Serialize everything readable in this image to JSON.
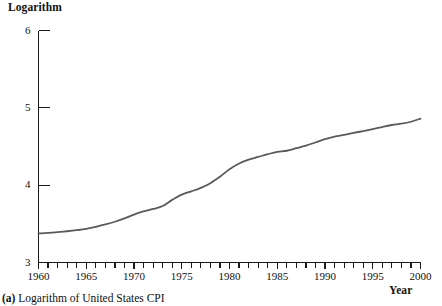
{
  "figure": {
    "caption_id": "(a)",
    "caption_text": " Logarithm of United States CPI"
  },
  "chart_data": {
    "type": "line",
    "title": "",
    "subtitle": "",
    "xlabel": "Year",
    "ylabel": "Logarithm",
    "xlim": [
      1960,
      2000
    ],
    "ylim": [
      3,
      6
    ],
    "grid": false,
    "legend": "none",
    "line_color": "#5a5a5a",
    "axis_color": "#1a1a1a",
    "y_ticks": [
      3,
      4,
      5,
      6
    ],
    "y_tick_labels": [
      "3",
      "4",
      "5",
      "6"
    ],
    "x_major_ticks": [
      1960,
      1965,
      1970,
      1975,
      1980,
      1985,
      1990,
      1995,
      2000
    ],
    "x_major_tick_labels": [
      "1960",
      "1965",
      "1970",
      "1975",
      "1980",
      "1985",
      "1990",
      "1995",
      "2000"
    ],
    "x_minor_tick_step": 1,
    "series": [
      {
        "name": "Logarithm of United States CPI",
        "x": [
          1960,
          1961,
          1962,
          1963,
          1964,
          1965,
          1966,
          1967,
          1968,
          1969,
          1970,
          1971,
          1972,
          1973,
          1974,
          1975,
          1976,
          1977,
          1978,
          1979,
          1980,
          1981,
          1982,
          1983,
          1984,
          1985,
          1986,
          1987,
          1988,
          1989,
          1990,
          1991,
          1992,
          1993,
          1994,
          1995,
          1996,
          1997,
          1998,
          1999,
          2000
        ],
        "values": [
          3.375,
          3.382,
          3.392,
          3.404,
          3.418,
          3.435,
          3.462,
          3.492,
          3.527,
          3.57,
          3.62,
          3.66,
          3.692,
          3.73,
          3.81,
          3.878,
          3.92,
          3.965,
          4.025,
          4.11,
          4.205,
          4.28,
          4.33,
          4.365,
          4.4,
          4.43,
          4.445,
          4.478,
          4.512,
          4.552,
          4.595,
          4.628,
          4.65,
          4.675,
          4.7,
          4.725,
          4.752,
          4.778,
          4.795,
          4.82,
          4.86
        ]
      }
    ]
  }
}
